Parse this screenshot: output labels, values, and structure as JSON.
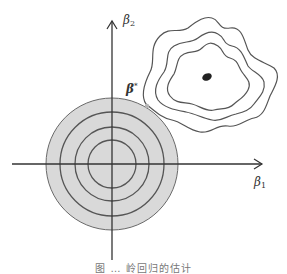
{
  "diagram": {
    "type": "ridge-regression-geometry",
    "axes": {
      "x_label": "β",
      "x_sub": "1",
      "y_label": "β",
      "y_sub": "2"
    },
    "point_label": "β",
    "point_sup": "*",
    "constraint_region": {
      "shape": "circle",
      "fill": "#d9d9d9",
      "ring_count": 4
    },
    "contours": {
      "count": 3,
      "center_marker": "filled-ellipse"
    },
    "caption": "图 … 岭回归的估计"
  },
  "colors": {
    "axis": "#333333",
    "circle_fill": "#d9d9d9",
    "circle_stroke": "#555555",
    "contour_stroke": "#555555",
    "center_dot": "#222222",
    "tangent_point": "#b5b5b5"
  }
}
